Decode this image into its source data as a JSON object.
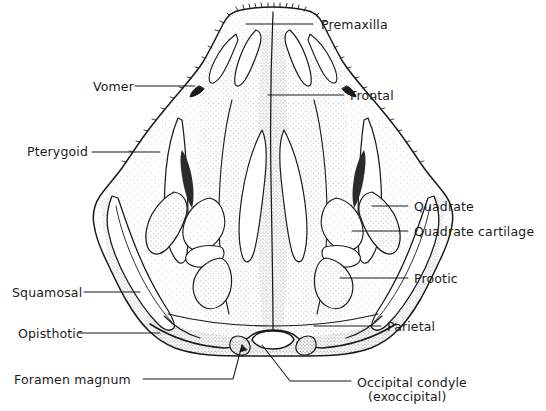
{
  "figure": {
    "background_color": "#ffffff",
    "ink_color": "#1a1a1a",
    "label_color": "#1a1a1a"
  },
  "labels": [
    {
      "id": "premaxilla",
      "text": "Premaxilla",
      "side": "right",
      "x": 321,
      "y": 18
    },
    {
      "id": "frontal",
      "text": "Frontal",
      "side": "right",
      "x": 350,
      "y": 89
    },
    {
      "id": "quadrate",
      "text": "Quadrate",
      "side": "right",
      "x": 414,
      "y": 200
    },
    {
      "id": "quadrate-cartilage",
      "text": "Quadrate cartilage",
      "side": "right",
      "x": 414,
      "y": 225
    },
    {
      "id": "prootic",
      "text": "Prootic",
      "side": "right",
      "x": 414,
      "y": 272
    },
    {
      "id": "parietal",
      "text": "Parietal",
      "side": "right",
      "x": 387,
      "y": 320
    },
    {
      "id": "occipital-condyle",
      "text": "Occipital condyle",
      "side": "right",
      "x": 357,
      "y": 375
    },
    {
      "id": "occipital-condyle-sub",
      "text": "(exoccipital)",
      "side": "right",
      "x": 368,
      "y": 389
    },
    {
      "id": "vomer",
      "text": "Vomer",
      "side": "left",
      "x": 93,
      "y": 80
    },
    {
      "id": "pterygoid",
      "text": "Pterygoid",
      "side": "left",
      "x": 27,
      "y": 145
    },
    {
      "id": "squamosal",
      "text": "Squamosal",
      "side": "left",
      "x": 12,
      "y": 286
    },
    {
      "id": "opisthotic",
      "text": "Opisthotic",
      "side": "left",
      "x": 18,
      "y": 327
    },
    {
      "id": "foramen-magnum",
      "text": "Foramen magnum",
      "side": "left",
      "x": 14,
      "y": 373
    }
  ],
  "leaders": [
    {
      "id": "premaxilla-leader",
      "path": "M313,24 L246,24"
    },
    {
      "id": "frontal-leader",
      "path": "M344,95 L268,95"
    },
    {
      "id": "quadrate-leader",
      "path": "M408,206 L372,206"
    },
    {
      "id": "quadrate-cartilage-leader",
      "path": "M408,231 L352,231"
    },
    {
      "id": "prootic-leader",
      "path": "M408,278 L340,278"
    },
    {
      "id": "parietal-leader",
      "path": "M381,326 L314,326"
    },
    {
      "id": "occipital-condyle-leader",
      "path": "M351,381 L290,381 L262,345"
    },
    {
      "id": "vomer-leader",
      "path": "M135,86 L195,86"
    },
    {
      "id": "pterygoid-leader",
      "path": "M92,152 L160,152"
    },
    {
      "id": "squamosal-leader",
      "path": "M84,292 L140,292"
    },
    {
      "id": "opisthotic-leader",
      "path": "M79,333 L160,333"
    },
    {
      "id": "foramen-magnum-leader",
      "path": "M143,379 L233,379 L242,345"
    }
  ]
}
